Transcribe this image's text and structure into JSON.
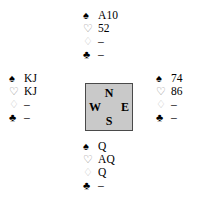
{
  "diagram": {
    "kind": "bridge-hand-diagram",
    "background_color": "#ffffff",
    "suit_order": [
      "spades",
      "hearts",
      "diamonds",
      "clubs"
    ],
    "suit_symbols": {
      "spades": "♠",
      "hearts": "♡",
      "diamonds": "♢",
      "clubs": "♣"
    },
    "suit_colors": {
      "spades": "#000000",
      "hearts": "#8a8a8a",
      "diamonds": "#bdbdbd",
      "clubs": "#000000"
    },
    "void_marker": "–"
  },
  "compass": {
    "north_label": "N",
    "east_label": "E",
    "south_label": "S",
    "west_label": "W",
    "fill_color": "#c9c9c9",
    "border_color": "#4a4a4a"
  },
  "hands": {
    "north": {
      "spades_symbol": "♠",
      "hearts_symbol": "♡",
      "diamonds_symbol": "♢",
      "clubs_symbol": "♣",
      "spades": "A10",
      "hearts": "52",
      "diamonds": "–",
      "clubs": "–"
    },
    "west": {
      "spades_symbol": "♠",
      "hearts_symbol": "♡",
      "diamonds_symbol": "♢",
      "clubs_symbol": "♣",
      "spades": "KJ",
      "hearts": "KJ",
      "diamonds": "–",
      "clubs": "–"
    },
    "east": {
      "spades_symbol": "♠",
      "hearts_symbol": "♡",
      "diamonds_symbol": "♢",
      "clubs_symbol": "♣",
      "spades": "74",
      "hearts": "86",
      "diamonds": "–",
      "clubs": "–"
    },
    "south": {
      "spades_symbol": "♠",
      "hearts_symbol": "♡",
      "diamonds_symbol": "♢",
      "clubs_symbol": "♣",
      "spades": "Q",
      "hearts": "AQ",
      "diamonds": "Q",
      "clubs": "–"
    }
  }
}
